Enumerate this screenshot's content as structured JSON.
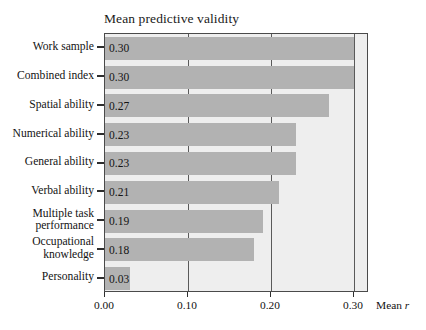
{
  "chart_data": {
    "type": "bar",
    "orientation": "horizontal",
    "title": "Mean predictive validity",
    "xlabel": "Mean r",
    "ylabel": "",
    "xlim": [
      0.0,
      0.32
    ],
    "xticks": [
      "0.00",
      "0.10",
      "0.20",
      "0.30"
    ],
    "xtick_values": [
      0.0,
      0.1,
      0.2,
      0.3
    ],
    "grid": "vertical",
    "legend": "none",
    "bar_color": "#b2b2b2",
    "plot_background": "#eeeeee",
    "frame_color": "#4a4a4a",
    "categories": [
      "Work sample",
      "Combined index",
      "Spatial ability",
      "Numerical ability",
      "General ability",
      "Verbal ability",
      "Multiple task performance",
      "Occupational knowledge",
      "Personality"
    ],
    "values": [
      0.3,
      0.3,
      0.27,
      0.23,
      0.23,
      0.21,
      0.19,
      0.18,
      0.03
    ],
    "data_labels": [
      "0.30",
      "0.30",
      "0.27",
      "0.23",
      "0.23",
      "0.21",
      "0.19",
      "0.18",
      "0.03"
    ]
  },
  "axis": {
    "y_labels": [
      {
        "lines": [
          "Work sample"
        ]
      },
      {
        "lines": [
          "Combined index"
        ]
      },
      {
        "lines": [
          "Spatial ability"
        ]
      },
      {
        "lines": [
          "Numerical ability"
        ]
      },
      {
        "lines": [
          "General ability"
        ]
      },
      {
        "lines": [
          "Verbal ability"
        ]
      },
      {
        "lines": [
          "Multiple task",
          "performance"
        ]
      },
      {
        "lines": [
          "Occupational",
          "knowledge"
        ]
      },
      {
        "lines": [
          "Personality"
        ]
      }
    ],
    "x_title_prefix": "Mean ",
    "x_title_symbol": "r"
  }
}
